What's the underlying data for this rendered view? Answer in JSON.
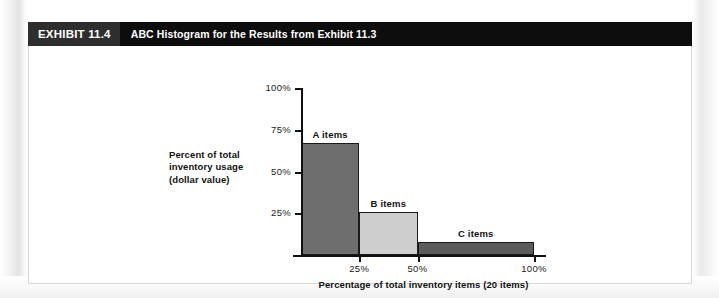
{
  "exhibit": {
    "number": "EXHIBIT 11.4",
    "title": "ABC Histogram for the Results from Exhibit 11.3"
  },
  "chart_data": {
    "type": "bar",
    "title": "ABC Histogram for the Results from Exhibit 11.3",
    "xlabel": "Percentage of total inventory items (20 items)",
    "ylabel": "Percent of total inventory usage (dollar value)",
    "ylabel_lines": [
      "Percent of total",
      "inventory usage",
      "(dollar value)"
    ],
    "categories": [
      "A items",
      "B items",
      "C items"
    ],
    "values": [
      67,
      26,
      8
    ],
    "bar_x_start": [
      0,
      25,
      50
    ],
    "bar_x_end": [
      25,
      50,
      100
    ],
    "bar_colors": [
      "#6e6e6e",
      "#cfcfcf",
      "#5b5b5b"
    ],
    "ylim": [
      0,
      100
    ],
    "yticks": [
      25,
      50,
      75,
      100
    ],
    "ytick_labels": [
      "25%",
      "50%",
      "75%",
      "100%"
    ],
    "xticks": [
      25,
      50,
      100
    ],
    "xtick_labels": [
      "25%",
      "50%",
      "100%"
    ],
    "grid": false,
    "legend": "none"
  }
}
